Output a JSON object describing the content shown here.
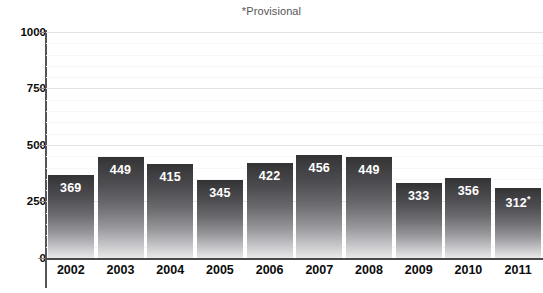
{
  "chart_data": {
    "type": "bar",
    "title": "*Provisional",
    "xlabel": "",
    "ylabel": "",
    "categories": [
      "2002",
      "2003",
      "2004",
      "2005",
      "2006",
      "2007",
      "2008",
      "2009",
      "2010",
      "2011"
    ],
    "values": [
      369,
      449,
      415,
      345,
      422,
      456,
      449,
      333,
      356,
      312
    ],
    "data_labels": [
      "369",
      "449",
      "415",
      "345",
      "422",
      "456",
      "449",
      "333",
      "356",
      "312*"
    ],
    "ylim": [
      0,
      1000
    ],
    "ytick_labels": [
      "0",
      "250",
      "500",
      "750",
      "1000"
    ],
    "ytick_values": [
      0,
      250,
      500,
      750,
      1000
    ],
    "minor_tick_step": 50,
    "grid": true,
    "grid_axis": "y",
    "legend": null,
    "annotations": [
      {
        "text": "*Provisional",
        "position": "top-center"
      },
      {
        "text": "*",
        "attached_to": "2011",
        "meaning": "provisional value"
      }
    ],
    "colors": {
      "bar_top": "#323235",
      "bar_bottom": "#e9e9ea",
      "axis": "#4a4a4e",
      "gridline": "#e3e3e6",
      "data_label_text": "#ffffff",
      "tick_label_text": "#0b0b0b",
      "title_text": "#555555",
      "background": "#ffffff"
    }
  }
}
